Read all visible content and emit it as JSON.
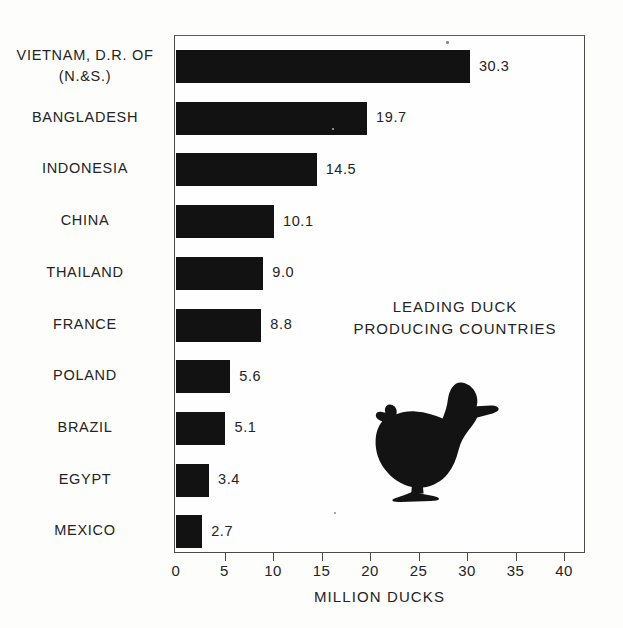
{
  "chart_data": {
    "type": "bar",
    "orientation": "horizontal",
    "title": "LEADING DUCK\nPRODUCING COUNTRIES",
    "title_lines": [
      "LEADING DUCK",
      "PRODUCING COUNTRIES"
    ],
    "xlabel": "MILLION DUCKS",
    "ylabel": "",
    "xlim": [
      0,
      42.2
    ],
    "xticks": [
      0,
      5,
      10,
      15,
      20,
      25,
      30,
      35,
      40
    ],
    "xtick_labels": [
      "0",
      "5",
      "10",
      "15",
      "20",
      "25",
      "30",
      "35",
      "40"
    ],
    "grid": false,
    "legend": null,
    "bar_color": "#121212",
    "categories": [
      "VIETNAM, D.R. OF\n(N.&S.)",
      "BANGLADESH",
      "INDONESIA",
      "CHINA",
      "THAILAND",
      "FRANCE",
      "POLAND",
      "BRAZIL",
      "EGYPT",
      "MEXICO"
    ],
    "values": [
      30.3,
      19.7,
      14.5,
      10.1,
      9.0,
      8.8,
      5.6,
      5.1,
      3.4,
      2.7
    ],
    "value_labels": [
      "30.3",
      "19.7",
      "14.5",
      "10.1",
      "9.0",
      "8.8",
      "5.6",
      "5.1",
      "3.4",
      "2.7"
    ]
  },
  "decoration": {
    "duck_icon": "duck-silhouette-icon"
  }
}
